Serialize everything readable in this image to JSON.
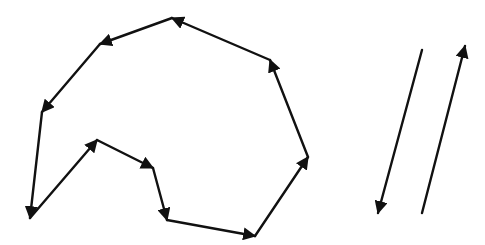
{
  "diagram": {
    "width": 485,
    "height": 245,
    "background": "#ffffff",
    "stroke_color": "#111111",
    "stroke_width": 2.4,
    "polygon": {
      "description": "closed polygon of directed edges traversed clockwise-on-screen",
      "vertices": [
        [
          30,
          218
        ],
        [
          97,
          140
        ],
        [
          153,
          168
        ],
        [
          167,
          220
        ],
        [
          255,
          236
        ],
        [
          308,
          157
        ],
        [
          270,
          60
        ],
        [
          172,
          18
        ],
        [
          100,
          44
        ],
        [
          42,
          112
        ]
      ],
      "edges": [
        {
          "from": 0,
          "to": 1,
          "arrow_at": "end"
        },
        {
          "from": 1,
          "to": 2,
          "arrow_at": "end"
        },
        {
          "from": 2,
          "to": 3,
          "arrow_at": "end"
        },
        {
          "from": 3,
          "to": 4,
          "arrow_at": "end"
        },
        {
          "from": 4,
          "to": 5,
          "arrow_at": "end"
        },
        {
          "from": 5,
          "to": 6,
          "arrow_at": "end"
        },
        {
          "from": 6,
          "to": 7,
          "arrow_at": "end"
        },
        {
          "from": 7,
          "to": 8,
          "arrow_at": "end"
        },
        {
          "from": 8,
          "to": 9,
          "arrow_at": "end"
        },
        {
          "from": 9,
          "to": 0,
          "arrow_at": "end"
        }
      ]
    },
    "parallel_vectors": [
      {
        "name": "vector-down",
        "from": [
          422,
          50
        ],
        "to": [
          378,
          213
        ]
      },
      {
        "name": "vector-up",
        "from": [
          422,
          213
        ],
        "to": [
          465,
          46
        ]
      }
    ]
  }
}
